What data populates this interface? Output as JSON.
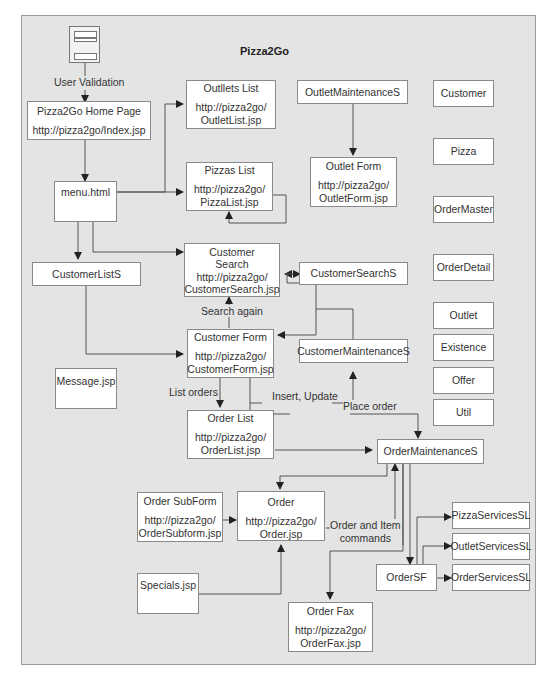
{
  "title": "Pizza2Go",
  "start_label": "User Validation",
  "boxes": {
    "home": {
      "title": "Pizza2Go Home Page",
      "url": "http://pizza2go/Index.jsp"
    },
    "outlets_list": {
      "title": "Outllets List",
      "url": "http://pizza2go/\nOutletList.jsp"
    },
    "outlet_maint": {
      "title": "OutletMaintenanceS"
    },
    "outlet_form": {
      "title": "Outlet Form",
      "url": "http://pizza2go/\nOutletForm.jsp"
    },
    "pizzas_list": {
      "title": "Pizzas List",
      "url": "http://pizza2go/\nPizzaList.jsp"
    },
    "menu": {
      "title": "menu.html"
    },
    "customer_lists": {
      "title": "CustomerListS"
    },
    "customer_search": {
      "title": "Customer\nSearch",
      "url": "http://pizza2go/\nCustomerSearch.jsp"
    },
    "customer_search_s": {
      "title": "CustomerSearchS"
    },
    "customer_form": {
      "title": "Customer Form",
      "url": "http://pizza2go/\nCustomerForm.jsp"
    },
    "customer_maint": {
      "title": "CustomerMaintenanceS"
    },
    "message": {
      "title": "Message.jsp"
    },
    "order_list": {
      "title": "Order List",
      "url": "http://pizza2go/\nOrderList.jsp"
    },
    "order_maint": {
      "title": "OrderMaintenanceS"
    },
    "order_subform": {
      "title": "Order SubForm",
      "url": "http://pizza2go/\nOrderSubform.jsp"
    },
    "order": {
      "title": "Order",
      "url": "http://pizza2go/\nOrder.jsp"
    },
    "specials": {
      "title": "Specials.jsp"
    },
    "order_fax": {
      "title": "Order Fax",
      "url": "http://pizza2go/\nOrderFax.jsp"
    },
    "order_sf": {
      "title": "OrderSF"
    },
    "pizza_services": {
      "title": "PizzaServicesSL"
    },
    "outlet_services": {
      "title": "OutletServicesSL"
    },
    "order_services": {
      "title": "OrderServicesSL"
    }
  },
  "entities": [
    "Customer",
    "Pizza",
    "OrderMaster",
    "OrderDetail",
    "Outlet",
    "Existence",
    "Offer",
    "Util"
  ],
  "edge_labels": {
    "search_again": "Search again",
    "list_orders": "List orders",
    "insert_update": "Insert, Update",
    "place_order": "Place order",
    "order_item_commands": "Order and Item\ncommands"
  }
}
